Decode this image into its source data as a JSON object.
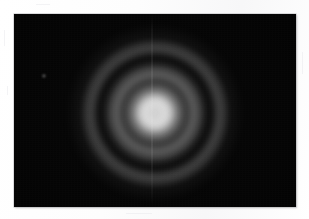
{
  "image": {
    "kind": "astronomical-detector-frame",
    "caption": "",
    "canvas": {
      "width": 309,
      "height": 219,
      "background_color": "#ffffff"
    },
    "frame": {
      "name": "detector-frame",
      "left": 14,
      "top": 14,
      "width": 282,
      "height": 193,
      "background_color": "#000000",
      "border_color": "#b9b9bd"
    }
  },
  "chart_data": {
    "type": "heatmap",
    "title": "",
    "subtitle": "",
    "xlabel": "",
    "ylabel": "",
    "grid": false,
    "legend": "none",
    "colormap": "grayscale",
    "value_range": [
      0,
      255
    ],
    "source": {
      "name": "point-source-psf",
      "center_x": 155,
      "center_y": 113,
      "peak_level": 219,
      "background_level": 4
    },
    "radial_profile": {
      "radius_px": [
        0,
        4,
        9,
        14,
        18,
        23,
        28,
        34,
        40,
        46,
        52,
        58,
        64,
        70,
        76,
        84,
        94
      ],
      "intensity": [
        205,
        219,
        214,
        186,
        140,
        104,
        92,
        86,
        74,
        52,
        28,
        16,
        26,
        44,
        31,
        12,
        3
      ]
    },
    "features": [
      {
        "name": "saturated-core",
        "type": "disk",
        "radius_px": 18,
        "peak_intensity": 219
      },
      {
        "name": "core-dimple",
        "type": "disk",
        "radius_px": 6,
        "peak_intensity": 198
      },
      {
        "name": "inner-dark-gap",
        "type": "annulus",
        "radius_px": 33,
        "peak_intensity": 62
      },
      {
        "name": "mid-bright-annulus",
        "type": "annulus",
        "radius_px": 45,
        "peak_intensity": 96
      },
      {
        "name": "outer-dark-gap",
        "type": "annulus",
        "radius_px": 58,
        "peak_intensity": 14
      },
      {
        "name": "outer-diffraction-ring",
        "type": "annulus",
        "radius_px": 70,
        "peak_intensity": 48
      },
      {
        "name": "faint-outer-halo",
        "type": "annulus",
        "radius_px": 88,
        "peak_intensity": 10
      }
    ],
    "artifacts": [
      {
        "name": "bleed-column",
        "type": "vertical-line",
        "x": 152,
        "y_top": 14,
        "y_bottom": 207,
        "width_px": 2,
        "intensity": 22
      },
      {
        "name": "field-source",
        "type": "point",
        "x": 44,
        "y": 76,
        "radius_px": 2,
        "intensity": 128
      }
    ]
  },
  "paper_specks": [
    {
      "x": 4,
      "y": 30,
      "w": 1,
      "h": 16
    },
    {
      "x": 7,
      "y": 86,
      "w": 1,
      "h": 9
    },
    {
      "x": 302,
      "y": 52,
      "w": 1,
      "h": 22
    },
    {
      "x": 126,
      "y": 213,
      "w": 26,
      "h": 1
    },
    {
      "x": 36,
      "y": 4,
      "w": 14,
      "h": 1
    }
  ]
}
